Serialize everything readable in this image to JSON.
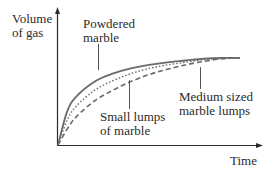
{
  "chart_data": {
    "type": "line",
    "title": "",
    "xlabel": "Time",
    "ylabel": "Volume of gas",
    "ylabel_lines": [
      "Volume",
      "of gas"
    ],
    "grid": false,
    "legend": "none (direct labels with leader lines)",
    "xlim": [
      0,
      1
    ],
    "ylim": [
      0,
      1
    ],
    "x": [
      0,
      0.05,
      0.1,
      0.2,
      0.3,
      0.4,
      0.5,
      0.6,
      0.7,
      0.8,
      0.9,
      1.0
    ],
    "series": [
      {
        "name": "Powdered marble",
        "label_lines": [
          "Powdered",
          "marble"
        ],
        "style": "solid",
        "values": [
          0,
          0.38,
          0.55,
          0.72,
          0.81,
          0.87,
          0.91,
          0.94,
          0.96,
          0.98,
          0.99,
          0.99
        ]
      },
      {
        "name": "Small lumps of marble",
        "label_lines": [
          "Small lumps",
          "of marble"
        ],
        "style": "dotted",
        "values": [
          0,
          0.28,
          0.44,
          0.62,
          0.73,
          0.81,
          0.87,
          0.91,
          0.94,
          0.97,
          0.98,
          0.99
        ]
      },
      {
        "name": "Medium sized marble lumps",
        "label_lines": [
          "Medium sized",
          "marble lumps"
        ],
        "style": "dashed",
        "values": [
          0,
          0.18,
          0.32,
          0.5,
          0.62,
          0.72,
          0.8,
          0.86,
          0.91,
          0.95,
          0.98,
          0.99
        ]
      }
    ]
  },
  "labels": {
    "ylabel_1": "Volume",
    "ylabel_2": "of gas",
    "xlabel": "Time",
    "powdered_1": "Powdered",
    "powdered_2": "marble",
    "small_1": "Small lumps",
    "small_2": "of marble",
    "medium_1": "Medium sized",
    "medium_2": "marble lumps"
  },
  "colors": {
    "axis": "#2b2b2b",
    "curve": "#6a6a6a",
    "text": "#2b2b2b"
  }
}
